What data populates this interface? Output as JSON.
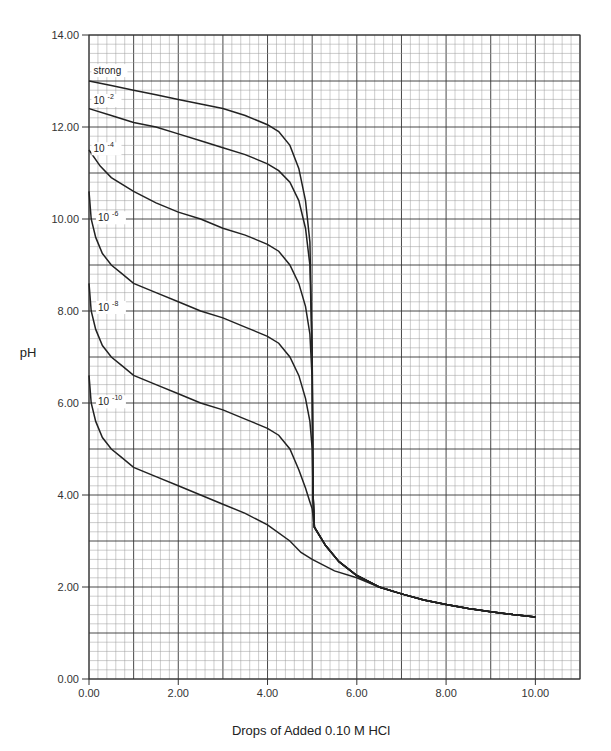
{
  "chart_data": {
    "type": "line",
    "title": "",
    "xlabel": "Drops of Added 0.10 M HCl",
    "ylabel": "pH",
    "xlim": [
      0,
      11
    ],
    "ylim": [
      0,
      14
    ],
    "grid": true,
    "x_ticks": [
      "0.00",
      "2.00",
      "4.00",
      "6.00",
      "8.00",
      "10.00"
    ],
    "y_ticks": [
      "0.00",
      "2.00",
      "4.00",
      "6.00",
      "8.00",
      "10.00",
      "12.00",
      "14.00"
    ],
    "legend_position": "inline labels near left edge",
    "series": [
      {
        "name": "strong",
        "label_base": "strong",
        "label_exp": "",
        "label_pos": [
          0.1,
          13.15
        ],
        "points": [
          [
            0,
            13.0
          ],
          [
            0.5,
            12.9
          ],
          [
            1,
            12.8
          ],
          [
            1.5,
            12.7
          ],
          [
            2,
            12.6
          ],
          [
            2.5,
            12.5
          ],
          [
            3,
            12.4
          ],
          [
            3.5,
            12.25
          ],
          [
            4,
            12.05
          ],
          [
            4.25,
            11.9
          ],
          [
            4.5,
            11.6
          ],
          [
            4.7,
            11.1
          ],
          [
            4.85,
            10.4
          ],
          [
            4.95,
            9.5
          ],
          [
            5.0,
            7.0
          ],
          [
            5.02,
            4.0
          ],
          [
            5.05,
            3.3
          ],
          [
            5.3,
            2.9
          ],
          [
            5.6,
            2.55
          ],
          [
            6,
            2.25
          ],
          [
            6.5,
            2.0
          ],
          [
            7,
            1.85
          ],
          [
            7.5,
            1.72
          ],
          [
            8,
            1.62
          ],
          [
            8.5,
            1.53
          ],
          [
            9,
            1.46
          ],
          [
            9.5,
            1.4
          ],
          [
            10,
            1.35
          ]
        ]
      },
      {
        "name": "10^-2",
        "label_base": "10",
        "label_exp": "-2",
        "label_pos": [
          0.1,
          12.5
        ],
        "points": [
          [
            0,
            12.4
          ],
          [
            0.5,
            12.25
          ],
          [
            1,
            12.1
          ],
          [
            1.5,
            12.0
          ],
          [
            2,
            11.85
          ],
          [
            2.5,
            11.7
          ],
          [
            3,
            11.55
          ],
          [
            3.5,
            11.4
          ],
          [
            4,
            11.2
          ],
          [
            4.25,
            11.05
          ],
          [
            4.5,
            10.8
          ],
          [
            4.7,
            10.4
          ],
          [
            4.85,
            9.8
          ],
          [
            4.95,
            9.0
          ],
          [
            5.0,
            7.0
          ],
          [
            5.02,
            4.0
          ],
          [
            5.05,
            3.3
          ],
          [
            5.3,
            2.9
          ],
          [
            5.6,
            2.55
          ],
          [
            6,
            2.25
          ],
          [
            6.5,
            2.0
          ],
          [
            7,
            1.85
          ],
          [
            7.5,
            1.72
          ],
          [
            8,
            1.62
          ],
          [
            8.5,
            1.53
          ],
          [
            9,
            1.46
          ],
          [
            9.5,
            1.4
          ],
          [
            10,
            1.35
          ]
        ]
      },
      {
        "name": "10^-4",
        "label_base": "10",
        "label_exp": "-4",
        "label_pos": [
          0.1,
          11.45
        ],
        "points": [
          [
            0,
            11.5
          ],
          [
            0.25,
            11.15
          ],
          [
            0.5,
            10.9
          ],
          [
            1,
            10.6
          ],
          [
            1.5,
            10.35
          ],
          [
            2,
            10.15
          ],
          [
            2.5,
            10.0
          ],
          [
            3,
            9.8
          ],
          [
            3.5,
            9.65
          ],
          [
            4,
            9.45
          ],
          [
            4.25,
            9.3
          ],
          [
            4.5,
            9.0
          ],
          [
            4.7,
            8.6
          ],
          [
            4.85,
            8.1
          ],
          [
            4.95,
            7.5
          ],
          [
            5.0,
            6.5
          ],
          [
            5.02,
            4.0
          ],
          [
            5.05,
            3.3
          ],
          [
            5.3,
            2.9
          ],
          [
            5.6,
            2.55
          ],
          [
            6,
            2.25
          ],
          [
            6.5,
            2.0
          ],
          [
            7,
            1.85
          ],
          [
            7.5,
            1.72
          ],
          [
            8,
            1.62
          ],
          [
            8.5,
            1.53
          ],
          [
            9,
            1.46
          ],
          [
            9.5,
            1.4
          ],
          [
            10,
            1.35
          ]
        ]
      },
      {
        "name": "10^-6",
        "label_base": "10",
        "label_exp": "-6",
        "label_pos": [
          0.2,
          9.95
        ],
        "points": [
          [
            0,
            10.6
          ],
          [
            0.05,
            10.0
          ],
          [
            0.15,
            9.6
          ],
          [
            0.3,
            9.25
          ],
          [
            0.5,
            9.0
          ],
          [
            0.75,
            8.8
          ],
          [
            1,
            8.6
          ],
          [
            1.5,
            8.4
          ],
          [
            2,
            8.2
          ],
          [
            2.5,
            8.0
          ],
          [
            3,
            7.85
          ],
          [
            3.5,
            7.65
          ],
          [
            4,
            7.45
          ],
          [
            4.25,
            7.3
          ],
          [
            4.5,
            7.0
          ],
          [
            4.7,
            6.6
          ],
          [
            4.85,
            6.1
          ],
          [
            4.95,
            5.6
          ],
          [
            5.0,
            5.0
          ],
          [
            5.02,
            4.0
          ],
          [
            5.05,
            3.3
          ],
          [
            5.3,
            2.9
          ],
          [
            5.6,
            2.55
          ],
          [
            6,
            2.25
          ],
          [
            6.5,
            2.0
          ],
          [
            7,
            1.85
          ],
          [
            7.5,
            1.72
          ],
          [
            8,
            1.62
          ],
          [
            8.5,
            1.53
          ],
          [
            9,
            1.46
          ],
          [
            9.5,
            1.4
          ],
          [
            10,
            1.35
          ]
        ]
      },
      {
        "name": "10^-8",
        "label_base": "10",
        "label_exp": "-8",
        "label_pos": [
          0.2,
          8.0
        ],
        "points": [
          [
            0,
            8.6
          ],
          [
            0.05,
            8.0
          ],
          [
            0.15,
            7.6
          ],
          [
            0.3,
            7.25
          ],
          [
            0.5,
            7.0
          ],
          [
            0.75,
            6.8
          ],
          [
            1,
            6.6
          ],
          [
            1.5,
            6.4
          ],
          [
            2,
            6.2
          ],
          [
            2.5,
            6.0
          ],
          [
            3,
            5.85
          ],
          [
            3.5,
            5.65
          ],
          [
            4,
            5.45
          ],
          [
            4.25,
            5.3
          ],
          [
            4.5,
            5.0
          ],
          [
            4.7,
            4.55
          ],
          [
            4.85,
            4.15
          ],
          [
            4.95,
            3.85
          ],
          [
            5.0,
            3.7
          ],
          [
            5.05,
            3.3
          ],
          [
            5.3,
            2.9
          ],
          [
            5.6,
            2.55
          ],
          [
            6,
            2.25
          ],
          [
            6.5,
            2.0
          ],
          [
            7,
            1.85
          ],
          [
            7.5,
            1.72
          ],
          [
            8,
            1.62
          ],
          [
            8.5,
            1.53
          ],
          [
            9,
            1.46
          ],
          [
            9.5,
            1.4
          ],
          [
            10,
            1.35
          ]
        ]
      },
      {
        "name": "10^-10",
        "label_base": "10",
        "label_exp": "-10",
        "label_pos": [
          0.2,
          5.95
        ],
        "points": [
          [
            0,
            6.6
          ],
          [
            0.05,
            6.0
          ],
          [
            0.15,
            5.6
          ],
          [
            0.3,
            5.25
          ],
          [
            0.5,
            5.0
          ],
          [
            0.75,
            4.8
          ],
          [
            1,
            4.6
          ],
          [
            1.5,
            4.4
          ],
          [
            2,
            4.2
          ],
          [
            2.5,
            4.0
          ],
          [
            3,
            3.8
          ],
          [
            3.5,
            3.6
          ],
          [
            4,
            3.35
          ],
          [
            4.5,
            3.0
          ],
          [
            4.75,
            2.75
          ],
          [
            5,
            2.6
          ],
          [
            5.5,
            2.35
          ],
          [
            6,
            2.2
          ],
          [
            6.5,
            2.0
          ],
          [
            7,
            1.85
          ],
          [
            7.5,
            1.72
          ],
          [
            8,
            1.62
          ],
          [
            8.5,
            1.53
          ],
          [
            9,
            1.46
          ],
          [
            9.5,
            1.4
          ],
          [
            10,
            1.35
          ]
        ]
      }
    ]
  }
}
